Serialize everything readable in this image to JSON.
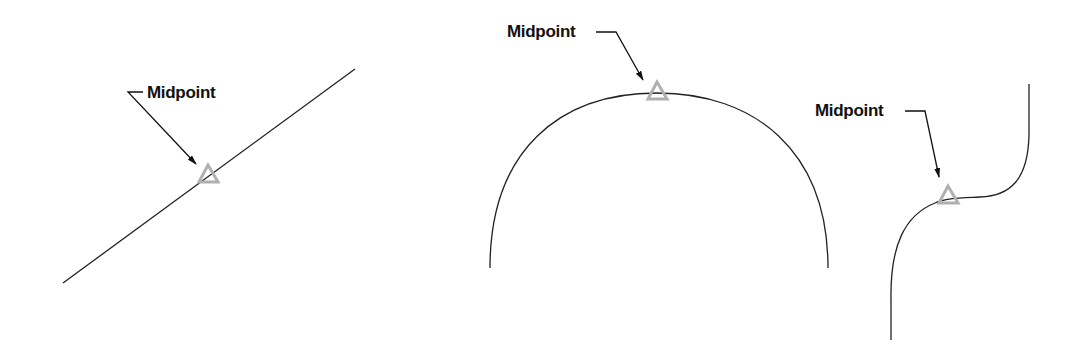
{
  "diagram": {
    "title": "",
    "colors": {
      "background": "#ffffff",
      "geometry_stroke": "#222222",
      "leader_stroke": "#111111",
      "midpoint_marker": "#b0b0b0",
      "label_text": "#111111"
    },
    "panels": [
      {
        "id": "line",
        "shape": "straight line",
        "label": "Midpoint",
        "marker": "triangle-icon"
      },
      {
        "id": "arc",
        "shape": "arc",
        "label": "Midpoint",
        "marker": "triangle-icon"
      },
      {
        "id": "spline",
        "shape": "spline curve",
        "label": "Midpoint",
        "marker": "triangle-icon"
      }
    ]
  }
}
